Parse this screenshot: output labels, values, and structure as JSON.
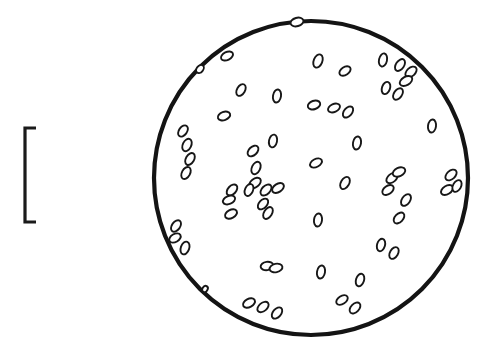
{
  "figure": {
    "type": "line-drawing",
    "background_color": "#ffffff",
    "ink_color": "#1a1a1a",
    "width": 489,
    "height": 358
  },
  "scale_bar": {
    "name": "scale-bar",
    "orientation": "vertical",
    "x": 25,
    "y_top": 128,
    "y_bottom": 222,
    "length_px": 94,
    "stroke_width": 3.2,
    "cap_length": 11,
    "cap_side": "right",
    "label": ""
  },
  "field": {
    "name": "field-of-view-circle",
    "cx": 311,
    "cy": 178,
    "r": 157,
    "stroke_width": 4.2,
    "fill": "#ffffff",
    "stroke": "#141414"
  },
  "particles": {
    "count": 58,
    "fill": "#ffffff",
    "stroke": "#171717",
    "stroke_width": 1.9,
    "items": [
      {
        "cx": 297,
        "cy": 22,
        "rx": 4.2,
        "ry": 6.6,
        "rot": 74
      },
      {
        "cx": 227,
        "cy": 56,
        "rx": 4.0,
        "ry": 6.4,
        "rot": 64
      },
      {
        "cx": 318,
        "cy": 61,
        "rx": 4.3,
        "ry": 6.9,
        "rot": 22
      },
      {
        "cx": 345,
        "cy": 71,
        "rx": 4.0,
        "ry": 6.2,
        "rot": 56
      },
      {
        "cx": 383,
        "cy": 60,
        "rx": 4.0,
        "ry": 6.7,
        "rot": 12
      },
      {
        "cx": 400,
        "cy": 65,
        "rx": 4.1,
        "ry": 6.6,
        "rot": 34
      },
      {
        "cx": 411,
        "cy": 72,
        "rx": 4.2,
        "ry": 6.6,
        "rot": 48
      },
      {
        "cx": 406,
        "cy": 81,
        "rx": 4.2,
        "ry": 6.8,
        "rot": 60
      },
      {
        "cx": 386,
        "cy": 88,
        "rx": 4.0,
        "ry": 6.3,
        "rot": 20
      },
      {
        "cx": 398,
        "cy": 94,
        "rx": 4.0,
        "ry": 6.4,
        "rot": 36
      },
      {
        "cx": 241,
        "cy": 90,
        "rx": 4.0,
        "ry": 6.4,
        "rot": 30
      },
      {
        "cx": 277,
        "cy": 96,
        "rx": 4.0,
        "ry": 6.6,
        "rot": 10
      },
      {
        "cx": 314,
        "cy": 105,
        "rx": 4.2,
        "ry": 6.4,
        "rot": 72
      },
      {
        "cx": 334,
        "cy": 108,
        "rx": 4.0,
        "ry": 6.3,
        "rot": 66
      },
      {
        "cx": 348,
        "cy": 112,
        "rx": 4.0,
        "ry": 6.4,
        "rot": 40
      },
      {
        "cx": 224,
        "cy": 116,
        "rx": 4.1,
        "ry": 6.4,
        "rot": 70
      },
      {
        "cx": 432,
        "cy": 126,
        "rx": 4.0,
        "ry": 6.6,
        "rot": 8
      },
      {
        "cx": 183,
        "cy": 131,
        "rx": 4.0,
        "ry": 6.3,
        "rot": 36
      },
      {
        "cx": 187,
        "cy": 145,
        "rx": 4.2,
        "ry": 6.6,
        "rot": 26
      },
      {
        "cx": 190,
        "cy": 159,
        "rx": 4.1,
        "ry": 6.5,
        "rot": 30
      },
      {
        "cx": 186,
        "cy": 173,
        "rx": 4.1,
        "ry": 6.5,
        "rot": 28
      },
      {
        "cx": 273,
        "cy": 141,
        "rx": 4.0,
        "ry": 6.5,
        "rot": 12
      },
      {
        "cx": 357,
        "cy": 143,
        "rx": 4.0,
        "ry": 6.6,
        "rot": 10
      },
      {
        "cx": 253,
        "cy": 151,
        "rx": 4.1,
        "ry": 6.4,
        "rot": 46
      },
      {
        "cx": 256,
        "cy": 168,
        "rx": 4.1,
        "ry": 6.6,
        "rot": 26
      },
      {
        "cx": 316,
        "cy": 163,
        "rx": 4.0,
        "ry": 6.4,
        "rot": 62
      },
      {
        "cx": 255,
        "cy": 183,
        "rx": 4.2,
        "ry": 6.6,
        "rot": 52
      },
      {
        "cx": 232,
        "cy": 190,
        "rx": 4.1,
        "ry": 6.5,
        "rot": 42
      },
      {
        "cx": 249,
        "cy": 190,
        "rx": 4.0,
        "ry": 6.3,
        "rot": 24
      },
      {
        "cx": 266,
        "cy": 190,
        "rx": 4.1,
        "ry": 6.6,
        "rot": 46
      },
      {
        "cx": 278,
        "cy": 188,
        "rx": 4.1,
        "ry": 6.5,
        "rot": 56
      },
      {
        "cx": 229,
        "cy": 200,
        "rx": 4.0,
        "ry": 6.4,
        "rot": 68
      },
      {
        "cx": 263,
        "cy": 204,
        "rx": 4.0,
        "ry": 6.3,
        "rot": 42
      },
      {
        "cx": 345,
        "cy": 183,
        "rx": 4.1,
        "ry": 6.6,
        "rot": 30
      },
      {
        "cx": 392,
        "cy": 178,
        "rx": 4.1,
        "ry": 6.5,
        "rot": 50
      },
      {
        "cx": 399,
        "cy": 172,
        "rx": 4.2,
        "ry": 6.6,
        "rot": 66
      },
      {
        "cx": 388,
        "cy": 190,
        "rx": 4.1,
        "ry": 6.4,
        "rot": 54
      },
      {
        "cx": 406,
        "cy": 200,
        "rx": 4.1,
        "ry": 6.5,
        "rot": 34
      },
      {
        "cx": 451,
        "cy": 175,
        "rx": 4.2,
        "ry": 6.6,
        "rot": 48
      },
      {
        "cx": 447,
        "cy": 190,
        "rx": 4.1,
        "ry": 6.6,
        "rot": 58
      },
      {
        "cx": 457,
        "cy": 186,
        "rx": 4.0,
        "ry": 6.3,
        "rot": 28
      },
      {
        "cx": 231,
        "cy": 214,
        "rx": 4.1,
        "ry": 6.4,
        "rot": 62
      },
      {
        "cx": 268,
        "cy": 213,
        "rx": 4.0,
        "ry": 6.5,
        "rot": 32
      },
      {
        "cx": 318,
        "cy": 220,
        "rx": 4.0,
        "ry": 6.6,
        "rot": 8
      },
      {
        "cx": 399,
        "cy": 218,
        "rx": 4.1,
        "ry": 6.4,
        "rot": 44
      },
      {
        "cx": 176,
        "cy": 226,
        "rx": 4.1,
        "ry": 6.4,
        "rot": 36
      },
      {
        "cx": 175,
        "cy": 238,
        "rx": 4.0,
        "ry": 6.2,
        "rot": 60
      },
      {
        "cx": 185,
        "cy": 248,
        "rx": 4.2,
        "ry": 6.6,
        "rot": 20
      },
      {
        "cx": 381,
        "cy": 245,
        "rx": 4.0,
        "ry": 6.4,
        "rot": 16
      },
      {
        "cx": 394,
        "cy": 253,
        "rx": 4.0,
        "ry": 6.4,
        "rot": 30
      },
      {
        "cx": 267,
        "cy": 266,
        "rx": 4.2,
        "ry": 6.4,
        "rot": 82
      },
      {
        "cx": 276,
        "cy": 268,
        "rx": 4.2,
        "ry": 6.5,
        "rot": 78
      },
      {
        "cx": 321,
        "cy": 272,
        "rx": 4.0,
        "ry": 6.6,
        "rot": 10
      },
      {
        "cx": 360,
        "cy": 280,
        "rx": 4.0,
        "ry": 6.5,
        "rot": 18
      },
      {
        "cx": 249,
        "cy": 303,
        "rx": 4.1,
        "ry": 6.4,
        "rot": 62
      },
      {
        "cx": 263,
        "cy": 307,
        "rx": 4.1,
        "ry": 6.5,
        "rot": 50
      },
      {
        "cx": 277,
        "cy": 313,
        "rx": 4.1,
        "ry": 6.5,
        "rot": 40
      },
      {
        "cx": 342,
        "cy": 300,
        "rx": 4.0,
        "ry": 6.4,
        "rot": 56
      },
      {
        "cx": 355,
        "cy": 308,
        "rx": 4.1,
        "ry": 6.5,
        "rot": 44
      },
      {
        "cx": 205,
        "cy": 289,
        "rx": 2.6,
        "ry": 3.4,
        "rot": 30
      },
      {
        "cx": 200,
        "cy": 69,
        "rx": 3.2,
        "ry": 4.6,
        "rot": 40
      }
    ]
  }
}
